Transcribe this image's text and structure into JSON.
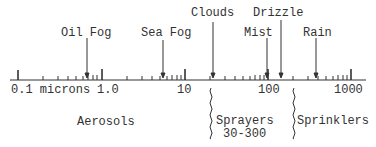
{
  "diagram": {
    "axis": {
      "unit_label": "0.1 microns",
      "scale": "log",
      "ticks": [
        {
          "value": 0.1,
          "label": "0.1 microns"
        },
        {
          "value": 1.0,
          "label": "1.0"
        },
        {
          "value": 10,
          "label": "10"
        },
        {
          "value": 100,
          "label": "100"
        },
        {
          "value": 1000,
          "label": "1000"
        }
      ]
    },
    "markers": [
      {
        "label": "Oil Fog",
        "approx_value": 0.65
      },
      {
        "label": "Sea Fog",
        "approx_value": 5.5
      },
      {
        "label": "Clouds",
        "approx_value": 20
      },
      {
        "label": "Mist",
        "approx_value": 95
      },
      {
        "label": "Drizzle",
        "approx_value": 140
      },
      {
        "label": "Rain",
        "approx_value": 370
      }
    ],
    "regions": [
      {
        "label": "Aerosols"
      },
      {
        "label": "Sprayers",
        "range": "30-300"
      },
      {
        "label": "Sprinklers"
      }
    ],
    "colors": {
      "ink": "#333333",
      "background": "#ffffff"
    }
  }
}
